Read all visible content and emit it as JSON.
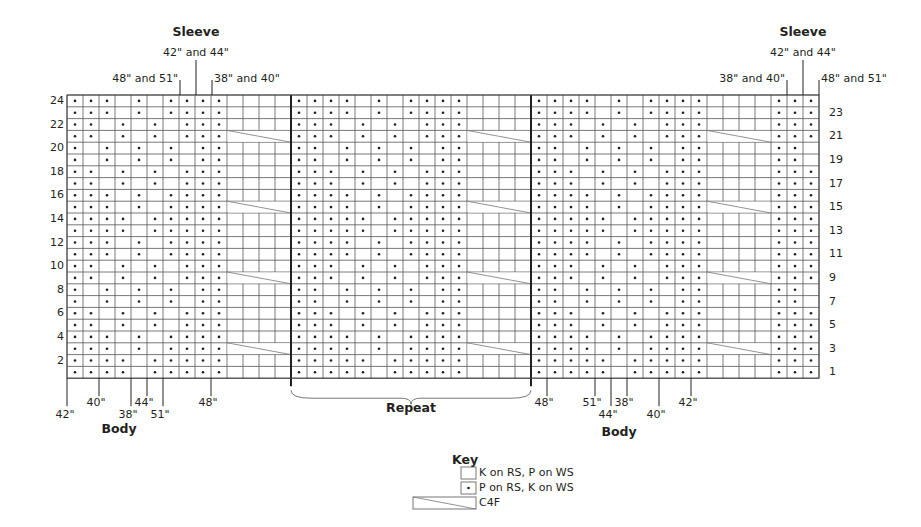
{
  "titles": {
    "sleeve_left": "Sleeve",
    "sleeve_right": "Sleeve",
    "body_left": "Body",
    "body_right": "Body",
    "repeat": "Repeat"
  },
  "top_size_labels_left": [
    {
      "text": "42\" and 44\"",
      "x": 196
    },
    {
      "text": "48\" and 51\"",
      "x": 180
    },
    {
      "text": "38\" and 40\"",
      "x": 212
    }
  ],
  "top_size_labels_right": [
    {
      "text": "42\" and 44\"",
      "x": 803
    },
    {
      "text": "38\" and 40\"",
      "x": 787
    },
    {
      "text": "48\" and 51\"",
      "x": 819
    }
  ],
  "bottom_size_labels_left": [
    {
      "text": "42\"",
      "x": 67,
      "level": 2
    },
    {
      "text": "40\"",
      "x": 99,
      "level": 1
    },
    {
      "text": "38\"",
      "x": 131,
      "level": 2
    },
    {
      "text": "44\"",
      "x": 147,
      "level": 1
    },
    {
      "text": "51\"",
      "x": 163,
      "level": 2
    },
    {
      "text": "48\"",
      "x": 211,
      "level": 1
    }
  ],
  "bottom_size_labels_right": [
    {
      "text": "48\"",
      "x": 547,
      "level": 1
    },
    {
      "text": "51\"",
      "x": 595,
      "level": 1
    },
    {
      "text": "44\"",
      "x": 611,
      "level": 2
    },
    {
      "text": "38\"",
      "x": 627,
      "level": 1
    },
    {
      "text": "40\"",
      "x": 659,
      "level": 2
    },
    {
      "text": "42\"",
      "x": 691,
      "level": 1
    }
  ],
  "row_labels_left": [
    2,
    4,
    6,
    8,
    10,
    12,
    14,
    16,
    18,
    20,
    22,
    24
  ],
  "row_labels_right": [
    1,
    3,
    5,
    7,
    9,
    11,
    13,
    15,
    17,
    19,
    21,
    23
  ],
  "key": {
    "title": "Key",
    "items": [
      {
        "symbol": "empty-square",
        "label": "K on RS, P on WS"
      },
      {
        "symbol": "dot-square",
        "label": "P on RS, K on WS"
      },
      {
        "symbol": "cable-c4f",
        "label": "C4F"
      }
    ]
  },
  "chart_data": {
    "type": "knitting-chart",
    "rows": 24,
    "columns": 47,
    "sections": [
      {
        "name": "left",
        "cols": 14,
        "pattern_cols": 10,
        "cable_cols": 4
      },
      {
        "name": "repeat",
        "cols": 15,
        "pattern_cols": 11,
        "cable_cols": 4
      },
      {
        "name": "right",
        "cols": 18,
        "pattern_cols": 11,
        "cable_cols": 4,
        "end_cols": 3
      }
    ],
    "cable_rows": [
      3,
      9,
      15,
      21
    ],
    "pattern_left_12row": [
      "1111011111",
      "1111011111",
      "1110101111",
      "1110101111",
      "1101010111",
      "1101010111",
      "1010101011",
      "1010101011",
      "1101010111",
      "1101010111",
      "1110101111",
      "1110101111"
    ],
    "pattern_mid_12row": [
      "11111011111",
      "11111011111",
      "11110101111",
      "11110101111",
      "11101010111",
      "11101010111",
      "11010101011",
      "11010101011",
      "11101010111",
      "11101010111",
      "11110101111",
      "11110101111"
    ],
    "end_right_12row": [
      "111",
      "111",
      "111",
      "111",
      "111",
      "111",
      "110",
      "110",
      "111",
      "111",
      "111",
      "111"
    ],
    "note": "pattern arrays listed from row 1 (bottom) upward; repeat every 12 rows; 1 = purl dot, 0 = blank knit"
  }
}
